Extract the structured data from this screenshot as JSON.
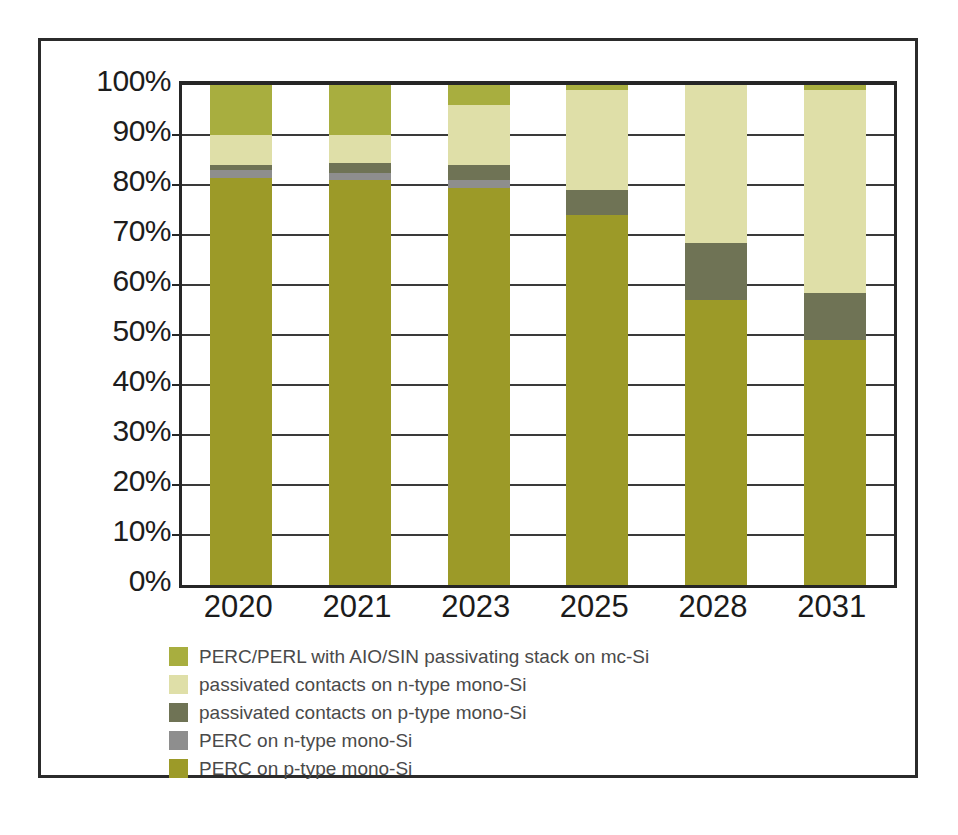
{
  "chart_data": {
    "type": "bar",
    "subtype": "100% stacked column",
    "title": "",
    "xlabel": "",
    "ylabel": "",
    "categories": [
      "2020",
      "2021",
      "2023",
      "2025",
      "2028",
      "2031"
    ],
    "ylim": [
      0,
      100
    ],
    "ytick_labels": [
      "0%",
      "10%",
      "20%",
      "30%",
      "40%",
      "50%",
      "60%",
      "70%",
      "80%",
      "90%",
      "100%"
    ],
    "ytick_values": [
      0,
      10,
      20,
      30,
      40,
      50,
      60,
      70,
      80,
      90,
      100
    ],
    "grid": true,
    "grid_axis": "y",
    "legend_position": "bottom-left",
    "stack_order_bottom_to_top": [
      "PERC on p-type mono-Si",
      "PERC on n-type mono-Si",
      "passivated contacts on p-type mono-Si",
      "passivated contacts on n-type mono-Si",
      "PERC/PERL with AIO/SIN passivating stack on mc-Si"
    ],
    "series": [
      {
        "name": "PERC on p-type mono-Si",
        "color": "#9c9a28",
        "values": [
          81.5,
          81.0,
          79.5,
          74.0,
          57.0,
          49.0
        ]
      },
      {
        "name": "PERC on n-type mono-Si",
        "color": "#8e8e8e",
        "values": [
          1.5,
          1.5,
          1.5,
          0.0,
          0.0,
          0.0
        ]
      },
      {
        "name": "passivated contacts on p-type mono-Si",
        "color": "#6f7355",
        "values": [
          1.0,
          2.0,
          3.0,
          5.0,
          11.5,
          9.5
        ]
      },
      {
        "name": "passivated contacts on n-type mono-Si",
        "color": "#dfdfa8",
        "values": [
          6.0,
          5.5,
          12.0,
          20.0,
          31.5,
          40.5
        ]
      },
      {
        "name": "PERC/PERL with AIO/SIN passivating stack on mc-Si",
        "color": "#a8ae3f",
        "values": [
          10.0,
          10.0,
          4.0,
          1.0,
          0.0,
          1.0
        ]
      }
    ]
  },
  "legend": {
    "items": [
      {
        "label": "PERC/PERL with AIO/SIN passivating stack on mc-Si",
        "color": "#a8ae3f"
      },
      {
        "label": "passivated contacts on n-type mono-Si",
        "color": "#dfdfa8"
      },
      {
        "label": "passivated contacts on p-type mono-Si",
        "color": "#6f7355"
      },
      {
        "label": "PERC on n-type mono-Si",
        "color": "#8e8e8e"
      },
      {
        "label": "PERC on p-type mono-Si",
        "color": "#9c9a28"
      }
    ]
  },
  "colors": {
    "frame": "#2b2b2b",
    "axis": "#262626",
    "gridline": "#3a3a3a",
    "tick_text": "#1c1c1c",
    "legend_text": "#4a4a4a",
    "background": "#ffffff"
  }
}
